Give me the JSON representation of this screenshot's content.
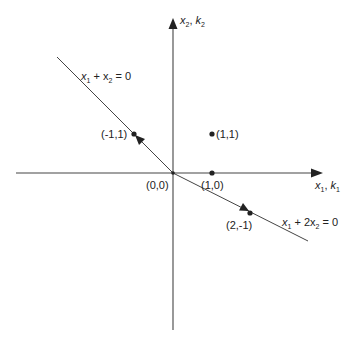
{
  "diagram": {
    "axes": {
      "horizontal": {
        "label": "x",
        "sub1": "1",
        "label2": "k",
        "sub2": "1"
      },
      "vertical": {
        "label": "x",
        "sub1": "2",
        "label2": "k",
        "sub2": "2"
      }
    },
    "lines": [
      {
        "id": "line-a",
        "equation_prefix": "x",
        "sub_a": "1",
        "mid": " + x",
        "sub_b": "2",
        "suffix": " = 0"
      },
      {
        "id": "line-b",
        "equation_prefix": "x",
        "sub_a": "1",
        "mid": " + 2x",
        "sub_b": "2",
        "suffix": " = 0"
      }
    ],
    "points": [
      {
        "label": "(1,1)"
      },
      {
        "label": "(1,0)"
      },
      {
        "label": "(-1,1)"
      },
      {
        "label": "(2,-1)"
      },
      {
        "label": "(0,0)"
      }
    ],
    "colors": {
      "stroke": "#333333",
      "line": "#555555"
    }
  }
}
